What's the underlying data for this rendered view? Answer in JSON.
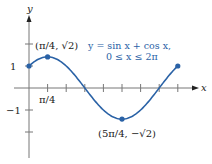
{
  "chart_data": {
    "type": "line",
    "title": "",
    "equation": "y = sin x + cos x,",
    "domain": "0 ≤ x ≤ 2π",
    "xlabel": "x",
    "ylabel": "y",
    "x_tick_labels": [
      "π/4"
    ],
    "y_tick_labels": [
      "1",
      "−1"
    ],
    "x_ticks_step": "π/4",
    "xlim": [
      0,
      6.2832
    ],
    "ylim": [
      -2,
      2
    ],
    "grid": false,
    "series": [
      {
        "name": "y = sin x + cos x",
        "function": "sin(x)+cos(x)",
        "x": [
          0,
          0.7854,
          1.5708,
          2.3562,
          3.1416,
          3.927,
          4.7124,
          5.4978,
          6.2832
        ],
        "values": [
          1,
          1.414,
          1,
          0,
          -1,
          -1.414,
          -1,
          0,
          1
        ]
      }
    ],
    "annotations": [
      {
        "label": "(π/4, √2)",
        "x": 0.7854,
        "y": 1.414
      },
      {
        "label": "(5π/4, −√2)",
        "x": 3.927,
        "y": -1.414
      }
    ],
    "marked_points": [
      {
        "x": 0,
        "y": 1
      },
      {
        "x": 0.7854,
        "y": 1.414
      },
      {
        "x": 3.927,
        "y": -1.414
      },
      {
        "x": 6.2832,
        "y": 1
      }
    ],
    "colors": {
      "curve": "#2a62a6",
      "axis": "#555555"
    }
  }
}
